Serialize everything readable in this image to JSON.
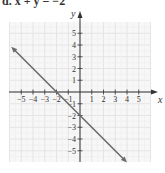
{
  "title": "d. x + y = −2",
  "chart_data": {
    "type": "line",
    "title": "x + y = −2",
    "xlabel": "x",
    "ylabel": "y",
    "xlim": [
      -6,
      6
    ],
    "ylim": [
      -6,
      6
    ],
    "grid": true,
    "x_ticks": [
      -5,
      -4,
      -3,
      -2,
      -1,
      1,
      2,
      3,
      4,
      5
    ],
    "y_ticks": [
      -5,
      -4,
      -3,
      -2,
      -1,
      1,
      2,
      3,
      4,
      5
    ],
    "x_tick_labels": [
      "−5",
      "−4",
      "−3",
      "−2",
      "−1",
      "1",
      "2",
      "3",
      "4",
      "5"
    ],
    "y_tick_labels": [
      "−5",
      "−4",
      "−3",
      "−2",
      "−1",
      "1",
      "2",
      "3",
      "4",
      "5"
    ],
    "series": [
      {
        "name": "x + y = −2",
        "x": [
          -6,
          -2,
          0,
          4
        ],
        "y": [
          4,
          0,
          -2,
          -6
        ],
        "arrows": "both",
        "color": "#6b6b6b"
      }
    ]
  },
  "colors": {
    "grid": "#e4e4e4",
    "grid_minor": "#efefef",
    "axis": "#333333",
    "line": "#6b6b6b"
  }
}
